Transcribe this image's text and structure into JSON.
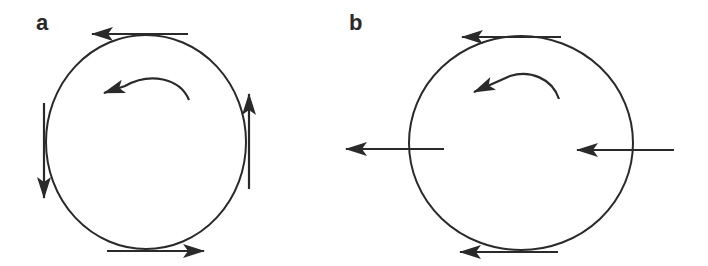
{
  "panels": [
    {
      "label": "a",
      "description": "Circle rotating counterclockwise with tangential velocity arrows",
      "circle": {
        "cx": 146,
        "cy": 142,
        "rx": 100,
        "ry": 107
      },
      "rotation_arrow": "counterclockwise",
      "arrows": [
        {
          "position": "top",
          "direction": "left"
        },
        {
          "position": "left",
          "direction": "down"
        },
        {
          "position": "bottom",
          "direction": "right"
        },
        {
          "position": "right",
          "direction": "up"
        }
      ]
    },
    {
      "label": "b",
      "description": "Circle rotating counterclockwise with uniform leftward flow arrows",
      "circle": {
        "cx": 521,
        "cy": 143,
        "rx": 112,
        "ry": 107
      },
      "rotation_arrow": "counterclockwise",
      "arrows": [
        {
          "position": "top",
          "direction": "left"
        },
        {
          "position": "left",
          "direction": "left"
        },
        {
          "position": "bottom",
          "direction": "left"
        },
        {
          "position": "right",
          "direction": "left"
        }
      ]
    }
  ],
  "colors": {
    "stroke": "#2a2a2a",
    "background": "#ffffff"
  }
}
